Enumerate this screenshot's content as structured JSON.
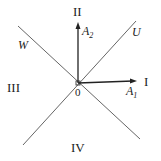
{
  "diagram": {
    "origin_label": "0",
    "quadrants": {
      "q1": "I",
      "q2": "II",
      "q3": "III",
      "q4": "IV"
    },
    "lines": {
      "diag_up": "U",
      "diag_down": "W"
    },
    "vectors": {
      "a1": {
        "base": "A",
        "sub": "1"
      },
      "a2": {
        "base": "A",
        "sub": "2"
      }
    },
    "colors": {
      "line": "#555555",
      "arrow": "#222222"
    }
  }
}
